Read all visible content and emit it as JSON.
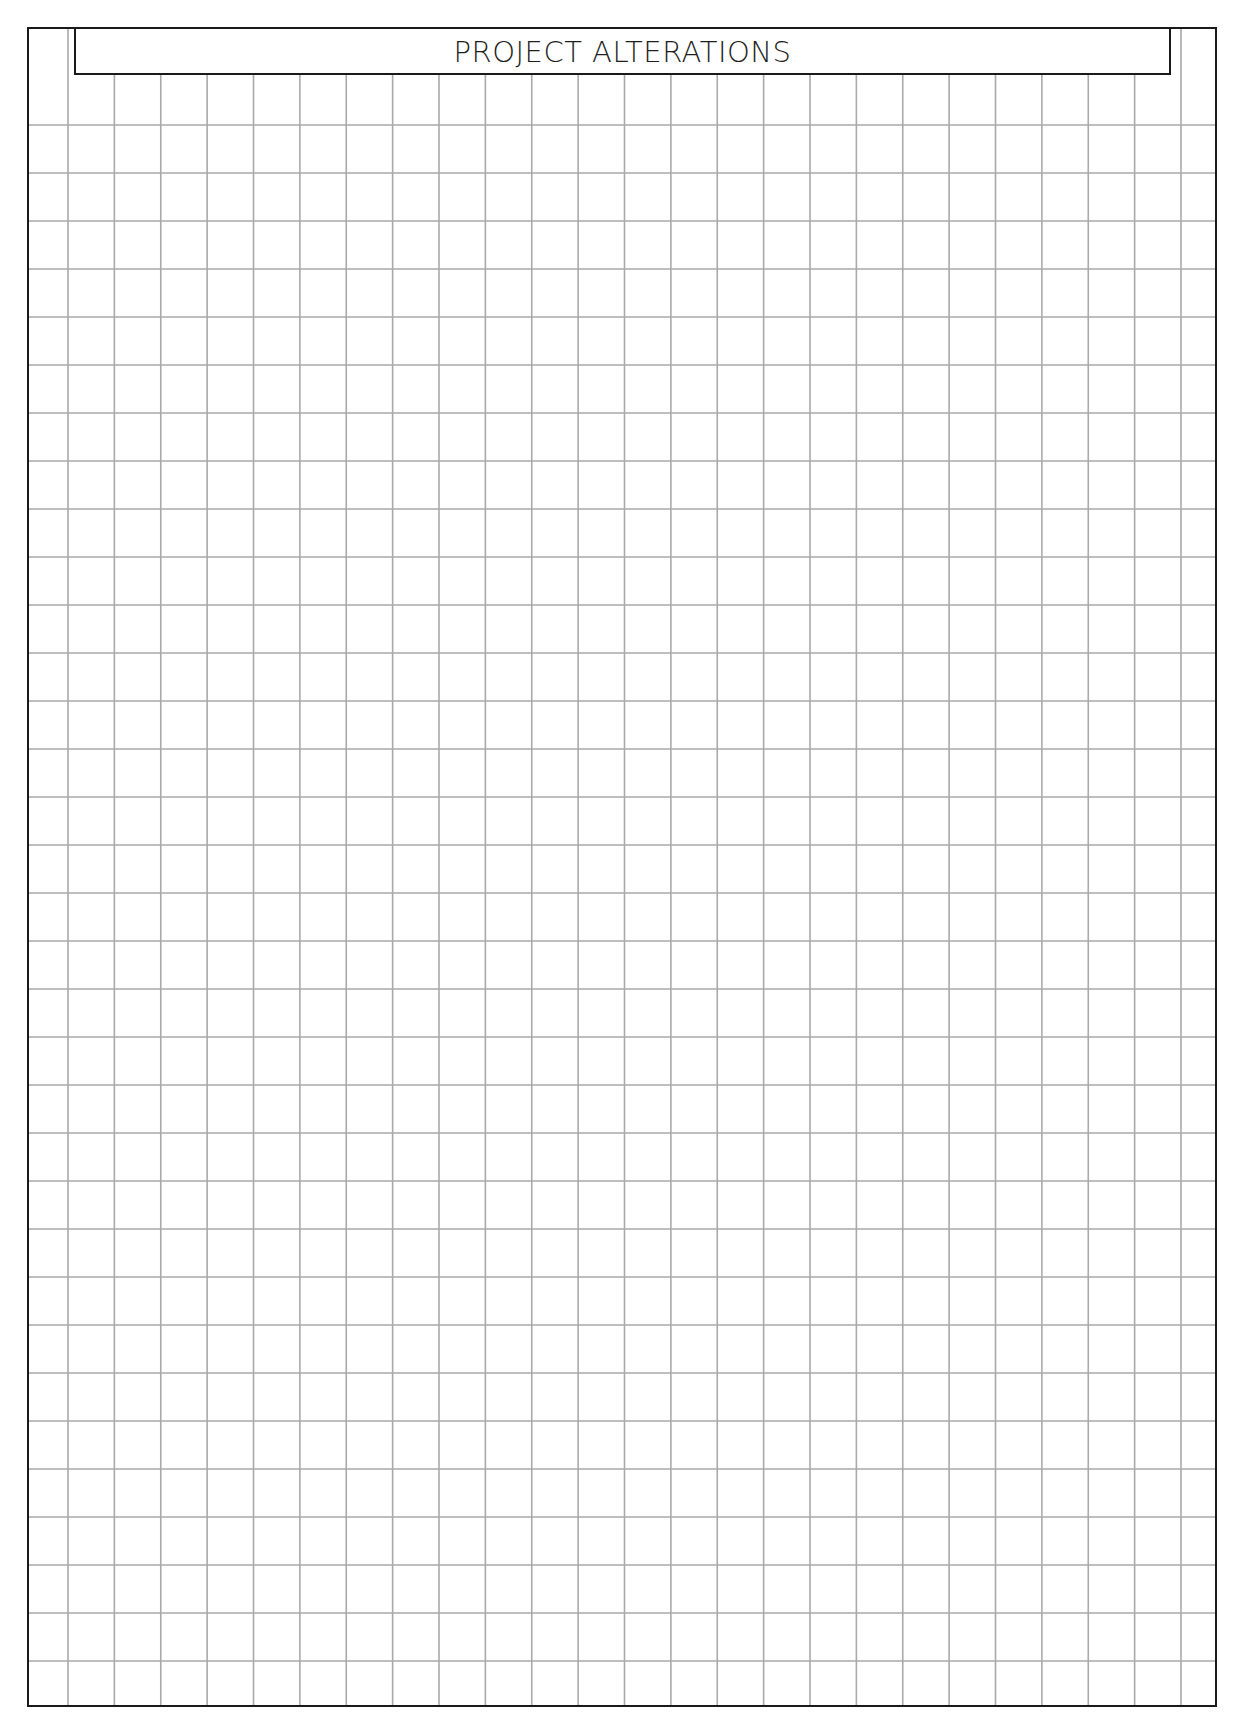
{
  "document": {
    "title": "PROJECT ALTERATIONS",
    "type": "graph-paper-sheet"
  },
  "frame": {
    "left": 27,
    "top": 27,
    "right": 1217,
    "bottom": 1707,
    "border_color": "#1a1a1a"
  },
  "header": {
    "left": 74,
    "right": 1171,
    "top": 27,
    "bottom": 75,
    "border_color": "#1a1a1a"
  },
  "grid": {
    "line_color": "#a9a9a9",
    "vertical_lines": {
      "first_x": 68,
      "spacing": 46.375,
      "count": 25
    },
    "horizontal_lines": {
      "first_y": 125,
      "spacing": 48,
      "count": 33
    }
  }
}
